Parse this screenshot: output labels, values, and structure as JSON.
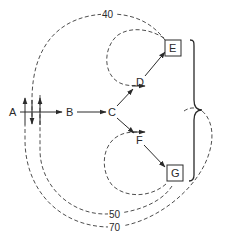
{
  "diagram": {
    "type": "flow-path-diagram",
    "nodes": {
      "a": "A",
      "b": "B",
      "c": "C",
      "d": "D",
      "e": "E",
      "f": "F",
      "g": "G"
    },
    "path_labels": {
      "outer_top": "40",
      "inner_bottom": "50",
      "outer_bottom": "70"
    },
    "edges": [
      {
        "from": "A",
        "to": "B",
        "style": "solid-arrow"
      },
      {
        "from": "B",
        "to": "C",
        "style": "solid-arrow"
      },
      {
        "from": "C",
        "to": "D",
        "style": "solid-arrow"
      },
      {
        "from": "D",
        "to": "E",
        "style": "solid-arrow"
      },
      {
        "from": "C",
        "to": "F",
        "style": "solid-arrow"
      },
      {
        "from": "F",
        "to": "G",
        "style": "solid-arrow"
      },
      {
        "from": "E",
        "to": "A",
        "style": "dashed",
        "label": "40"
      },
      {
        "from": "G",
        "to": "A",
        "style": "dashed",
        "label": "50"
      },
      {
        "from": "brace",
        "to": "A",
        "style": "dashed",
        "label": "70"
      },
      {
        "from": "E",
        "to": "D-side",
        "style": "dashed-loop"
      },
      {
        "from": "G",
        "to": "F-side",
        "style": "dashed-loop"
      }
    ],
    "grouping": "right curly brace spanning E to G"
  }
}
